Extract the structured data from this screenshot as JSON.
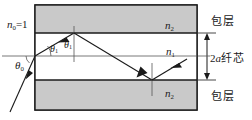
{
  "figure": {
    "labels": {
      "n0": "n₀=1",
      "n2_top": "n₂",
      "n1": "n₁",
      "n2_bottom": "n₂",
      "cladding_top": "包层",
      "cladding_bottom": "包层",
      "core": "2a纤芯",
      "theta0": "θ₀",
      "theta1_left": "θ₁",
      "theta1_right": "θ₁"
    },
    "label_parts": {
      "n0_base": "n",
      "n0_sub": "0",
      "n0_eq": "=1",
      "n2_base": "n",
      "n2_sub": "2",
      "n1_base": "n",
      "n1_sub": "1",
      "core_num": "2",
      "core_a": "a",
      "core_cjk": "纤芯",
      "theta_base": "θ",
      "theta0_sub": "0",
      "theta1_sub": "1"
    },
    "colors": {
      "cladding_fill": "#c9c9c9",
      "core_fill": "#ffffff",
      "outline": "#1a1a1a",
      "ray": "#1a1a1a",
      "background": "#ffffff"
    },
    "geometry": {
      "box_left": 35,
      "box_right": 197,
      "box_top": 5,
      "box_bottom": 110,
      "core_top": 33,
      "core_bottom": 80
    }
  }
}
